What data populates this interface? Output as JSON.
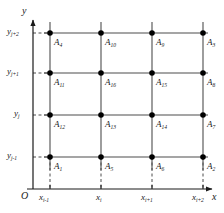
{
  "figure": {
    "type": "grid-diagram",
    "axes": {
      "x_axis_name": "x",
      "y_axis_name": "y",
      "origin_label": "O"
    },
    "x_ticks": [
      {
        "base": "x",
        "sub": "i-1"
      },
      {
        "base": "x",
        "sub": "i"
      },
      {
        "base": "x",
        "sub": "i+1"
      },
      {
        "base": "x",
        "sub": "i+2"
      }
    ],
    "y_ticks": [
      {
        "base": "y",
        "sub": "j+2"
      },
      {
        "base": "y",
        "sub": "j+1"
      },
      {
        "base": "y",
        "sub": "j"
      },
      {
        "base": "y",
        "sub": "j-1"
      }
    ],
    "nodes": [
      {
        "base": "A",
        "sub": "4",
        "row": 0,
        "col": 0
      },
      {
        "base": "A",
        "sub": "10",
        "row": 0,
        "col": 1
      },
      {
        "base": "A",
        "sub": "9",
        "row": 0,
        "col": 2
      },
      {
        "base": "A",
        "sub": "3",
        "row": 0,
        "col": 3
      },
      {
        "base": "A",
        "sub": "11",
        "row": 1,
        "col": 0
      },
      {
        "base": "A",
        "sub": "16",
        "row": 1,
        "col": 1
      },
      {
        "base": "A",
        "sub": "15",
        "row": 1,
        "col": 2
      },
      {
        "base": "A",
        "sub": "8",
        "row": 1,
        "col": 3
      },
      {
        "base": "A",
        "sub": "12",
        "row": 2,
        "col": 0
      },
      {
        "base": "A",
        "sub": "13",
        "row": 2,
        "col": 1
      },
      {
        "base": "A",
        "sub": "14",
        "row": 2,
        "col": 2
      },
      {
        "base": "A",
        "sub": "7",
        "row": 2,
        "col": 3
      },
      {
        "base": "A",
        "sub": "1",
        "row": 3,
        "col": 0
      },
      {
        "base": "A",
        "sub": "5",
        "row": 3,
        "col": 1
      },
      {
        "base": "A",
        "sub": "6",
        "row": 3,
        "col": 2
      },
      {
        "base": "A",
        "sub": "2",
        "row": 3,
        "col": 3
      }
    ],
    "colors": {
      "line": "#4d4d4d",
      "axis": "#1a1a1a",
      "node": "#000000",
      "text": "#1a1a1a",
      "background": "#ffffff"
    }
  }
}
